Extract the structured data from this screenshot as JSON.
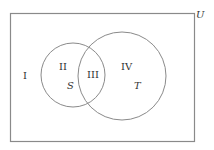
{
  "diagram": {
    "type": "venn",
    "universe_label": "U",
    "sets": [
      {
        "name": "S",
        "label": "S"
      },
      {
        "name": "T",
        "label": "T"
      }
    ],
    "regions": [
      {
        "id": "I",
        "label": "I",
        "description": "outside S and T"
      },
      {
        "id": "II",
        "label": "II",
        "description": "S only"
      },
      {
        "id": "III",
        "label": "III",
        "description": "S and T"
      },
      {
        "id": "IV",
        "label": "IV",
        "description": "T only"
      }
    ],
    "colors": {
      "stroke": "#888888",
      "text": "#333333",
      "background": "#ffffff"
    }
  }
}
